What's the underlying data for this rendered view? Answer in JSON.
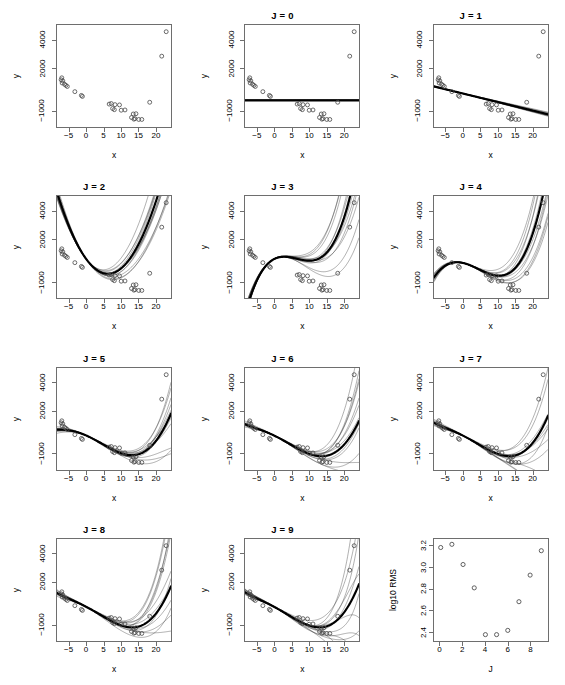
{
  "figure": {
    "layout": "4 rows x 3 columns of panels",
    "n_panels": 12
  },
  "axis": {
    "xlabel": "x",
    "ylabel": "y",
    "xticks": [
      -5,
      0,
      5,
      10,
      15,
      20
    ],
    "yticks": [
      -1000,
      2000,
      4000
    ],
    "xlim": [
      -8.6,
      24.6
    ],
    "ylim": [
      -2200,
      5100
    ]
  },
  "rms_axis": {
    "xlabel": "J",
    "ylabel": "log10 RMS",
    "xticks": [
      0,
      2,
      4,
      6,
      8
    ],
    "yticks": [
      2.4,
      2.6,
      2.8,
      3.0,
      3.2
    ],
    "xlim": [
      -0.6,
      9.6
    ],
    "ylim": [
      2.31,
      3.27
    ]
  },
  "panels": [
    {
      "id": "data",
      "title": "",
      "has_title": false,
      "type": "scatter"
    },
    {
      "id": "J0",
      "title": "J = 0",
      "has_title": true,
      "type": "fit",
      "order": 0
    },
    {
      "id": "J1",
      "title": "J = 1",
      "has_title": true,
      "type": "fit",
      "order": 1
    },
    {
      "id": "J2",
      "title": "J = 2",
      "has_title": true,
      "type": "fit",
      "order": 2
    },
    {
      "id": "J3",
      "title": "J = 3",
      "has_title": true,
      "type": "fit",
      "order": 3
    },
    {
      "id": "J4",
      "title": "J = 4",
      "has_title": true,
      "type": "fit",
      "order": 4
    },
    {
      "id": "J5",
      "title": "J = 5",
      "has_title": true,
      "type": "fit",
      "order": 5
    },
    {
      "id": "J6",
      "title": "J = 6",
      "has_title": true,
      "type": "fit",
      "order": 6
    },
    {
      "id": "J7",
      "title": "J = 7",
      "has_title": true,
      "type": "fit",
      "order": 7
    },
    {
      "id": "J8",
      "title": "J = 8",
      "has_title": true,
      "type": "fit",
      "order": 8
    },
    {
      "id": "J9",
      "title": "J = 9",
      "has_title": true,
      "type": "fit",
      "order": 9
    },
    {
      "id": "rms",
      "title": "",
      "has_title": false,
      "type": "rms"
    }
  ],
  "chart_data": {
    "type": "scatter",
    "title": "",
    "xlabel": "x",
    "ylabel": "y",
    "xlim": [
      -8.6,
      24.6
    ],
    "ylim": [
      -2200,
      5100
    ],
    "grid": false,
    "points": [
      {
        "x": -7.4,
        "y": 1180
      },
      {
        "x": -7.2,
        "y": 1320
      },
      {
        "x": -7.1,
        "y": 950
      },
      {
        "x": -6.9,
        "y": 1100
      },
      {
        "x": -6.4,
        "y": 860
      },
      {
        "x": -6.0,
        "y": 780
      },
      {
        "x": -5.6,
        "y": 700
      },
      {
        "x": -3.4,
        "y": 330
      },
      {
        "x": -1.5,
        "y": 60
      },
      {
        "x": -1.2,
        "y": -10
      },
      {
        "x": 6.6,
        "y": -560
      },
      {
        "x": 7.2,
        "y": -520
      },
      {
        "x": 7.6,
        "y": -880
      },
      {
        "x": 8.1,
        "y": -960
      },
      {
        "x": 8.3,
        "y": -600
      },
      {
        "x": 9.6,
        "y": -620
      },
      {
        "x": 10.1,
        "y": -1000
      },
      {
        "x": 11.2,
        "y": -980
      },
      {
        "x": 13.1,
        "y": -1520
      },
      {
        "x": 13.6,
        "y": -1270
      },
      {
        "x": 13.8,
        "y": -1640
      },
      {
        "x": 14.1,
        "y": -1600
      },
      {
        "x": 14.4,
        "y": -1250
      },
      {
        "x": 15.2,
        "y": -1660
      },
      {
        "x": 16.1,
        "y": -1660
      },
      {
        "x": 18.4,
        "y": -430
      },
      {
        "x": 21.9,
        "y": 2870
      },
      {
        "x": 23.2,
        "y": 4620
      }
    ],
    "series": [
      {
        "name": "J = 0",
        "order": 0,
        "coeffs": [
          -290
        ]
      },
      {
        "name": "J = 1",
        "order": 1,
        "coeffs": [
          185,
          -60
        ]
      },
      {
        "name": "J = 2",
        "order": 2,
        "coeffs": [
          560,
          -330,
          26.5
        ]
      },
      {
        "name": "J = 3",
        "order": 3,
        "coeffs": [
          600,
          120,
          -27.5,
          1.42
        ]
      },
      {
        "name": "J = 4",
        "order": 4,
        "coeffs": [
          300,
          -60,
          -13.0,
          0.95,
          0.005
        ]
      },
      {
        "name": "J = 5",
        "order": 5,
        "coeffs": [
          260,
          -110,
          -6.0,
          0.3,
          0.018,
          -0.00035
        ]
      },
      {
        "name": "J = 6",
        "order": 6,
        "coeffs": [
          250,
          -120,
          -4.0,
          0.12,
          0.025,
          -0.0006,
          4e-06
        ]
      },
      {
        "name": "J = 7",
        "order": 7,
        "coeffs": [
          240,
          -125,
          -3.5,
          0.1,
          0.027,
          -0.00065,
          5e-06,
          0
        ]
      },
      {
        "name": "J = 8",
        "order": 8,
        "coeffs": [
          235,
          -130,
          -3.2,
          0.09,
          0.028,
          -0.0007,
          6e-06,
          0,
          0
        ]
      },
      {
        "name": "J = 9",
        "order": 9,
        "coeffs": [
          230,
          -132,
          -3.0,
          0.08,
          0.029,
          -0.00072,
          6.2e-06,
          0,
          0,
          0
        ]
      }
    ]
  },
  "rms_chart": {
    "type": "scatter",
    "title": "",
    "xlabel": "J",
    "ylabel": "log10 RMS",
    "xlim": [
      -0.6,
      9.6
    ],
    "ylim": [
      2.31,
      3.27
    ],
    "grid": false,
    "x": [
      0,
      1,
      2,
      3,
      4,
      5,
      6,
      7,
      8,
      9
    ],
    "values": [
      3.19,
      3.22,
      3.03,
      2.81,
      2.37,
      2.37,
      2.41,
      2.68,
      2.93,
      3.16
    ]
  }
}
